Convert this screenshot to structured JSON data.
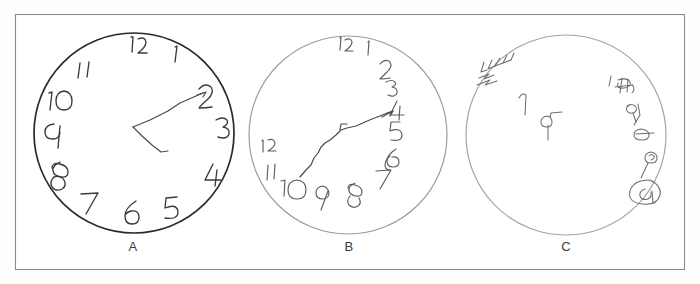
{
  "figure": {
    "type": "clock-drawing-test",
    "background_color": "#fefefe",
    "frame_color": "#8b8b8b",
    "ink_color": "#3a3a3a",
    "width": 700,
    "height": 284
  },
  "panels": [
    {
      "id": "A",
      "label": "A",
      "label_x": 133,
      "label_y": 242,
      "circle": {
        "cx": 134,
        "cy": 133,
        "r": 100,
        "stroke": "#2a2a2a",
        "stroke_width": 1.7
      },
      "description": "Intact clock drawing: closed circle, all twelve numbers placed in correct clockwise sequence around the circumference, two hands drawn from center.",
      "numbers": [
        {
          "text": "12",
          "x": 139,
          "y": 44
        },
        {
          "text": "1",
          "x": 176,
          "y": 54
        },
        {
          "text": "2",
          "x": 208,
          "y": 96
        },
        {
          "text": "3",
          "x": 222,
          "y": 128
        },
        {
          "text": "4",
          "x": 213,
          "y": 172
        },
        {
          "text": "5",
          "x": 171,
          "y": 208
        },
        {
          "text": "6",
          "x": 129,
          "y": 219
        },
        {
          "text": "7",
          "x": 90,
          "y": 205
        },
        {
          "text": "8",
          "x": 60,
          "y": 175
        },
        {
          "text": "9",
          "x": 48,
          "y": 131
        },
        {
          "text": "10",
          "x": 58,
          "y": 100
        },
        {
          "text": "11",
          "x": 84,
          "y": 70
        }
      ],
      "hands": [
        {
          "name": "long-hand",
          "points_to": "2",
          "from": [
            133,
            127
          ],
          "to": [
            203,
            93
          ]
        },
        {
          "name": "short-hand",
          "points_to": "between 4 and 5",
          "from": [
            133,
            127
          ],
          "to": [
            166,
            150
          ]
        }
      ]
    },
    {
      "id": "B",
      "label": "B",
      "label_x": 349,
      "label_y": 242,
      "circle": {
        "cx": 348,
        "cy": 135,
        "r": 99,
        "stroke": "#9a9a9a",
        "stroke_width": 1.15
      },
      "description": "Moderately impaired clock: circle intact but numbers are crowded and stacked down the right-hand side, 11 and 12 drift to the left margin, a single wandering line replaces the hands.",
      "numbers": [
        {
          "text": "12",
          "x": 345,
          "y": 44
        },
        {
          "text": "1",
          "x": 369,
          "y": 48
        },
        {
          "text": "2",
          "x": 386,
          "y": 71
        },
        {
          "text": "3",
          "x": 391,
          "y": 88
        },
        {
          "text": "4",
          "x": 396,
          "y": 110
        },
        {
          "text": "5",
          "x": 395,
          "y": 130
        },
        {
          "text": "6",
          "x": 391,
          "y": 158
        },
        {
          "text": "7",
          "x": 383,
          "y": 178
        },
        {
          "text": "8",
          "x": 355,
          "y": 193
        },
        {
          "text": "9",
          "x": 322,
          "y": 198
        },
        {
          "text": "10",
          "x": 292,
          "y": 190
        },
        {
          "text": "11",
          "x": 271,
          "y": 173
        },
        {
          "text": "12",
          "x": 266,
          "y": 150,
          "rotated": true
        }
      ],
      "hands": [
        {
          "name": "single-wandering-line",
          "points_to": "4",
          "from": [
            302,
            175
          ],
          "to": [
            392,
            110
          ]
        }
      ]
    },
    {
      "id": "C",
      "label": "C",
      "label_x": 566,
      "label_y": 242,
      "circle": {
        "cx": 566,
        "cy": 135,
        "r": 100,
        "stroke": "#a3a3a3",
        "stroke_width": 1.15
      },
      "description": "Severely impaired clock: circle present but contents are disorganized illegible scribbles, repetitive vertical strokes clustered upper left, unrecognizable marks along the right edge, no hands and no correct numbers.",
      "numbers": [],
      "scribbles": [
        {
          "name": "repetitive-strokes-upper-left",
          "x": 490,
          "y": 70
        },
        {
          "name": "stray-mark-center-left",
          "x": 522,
          "y": 103
        },
        {
          "name": "stray-mark-center",
          "x": 549,
          "y": 121
        },
        {
          "name": "scribble-upper-right",
          "x": 622,
          "y": 86
        },
        {
          "name": "scribble-right-upper-mid",
          "x": 636,
          "y": 110
        },
        {
          "name": "scribble-right-mid",
          "x": 645,
          "y": 128
        },
        {
          "name": "scribble-right-lower",
          "x": 655,
          "y": 158
        },
        {
          "name": "scribble-bottom-right-loop",
          "x": 650,
          "y": 190
        }
      ],
      "hands": []
    }
  ]
}
